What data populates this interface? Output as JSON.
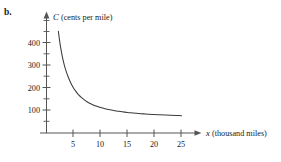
{
  "part_label": "b.",
  "chart_data": {
    "type": "line",
    "title": "",
    "xlabel_var": "x",
    "xlabel_units": "(thousand miles)",
    "ylabel_var": "C",
    "ylabel_units": "(cents per mile)",
    "xlim": [
      0,
      29
    ],
    "ylim": [
      0,
      480
    ],
    "grid": false,
    "legend": "none",
    "x_ticks_major": [
      5,
      10,
      15,
      20,
      25
    ],
    "x_tick_labels": [
      "5",
      "10",
      "15",
      "20",
      "25"
    ],
    "y_ticks_major": [
      100,
      200,
      300,
      400
    ],
    "y_tick_labels": [
      "100",
      "200",
      "300",
      "400"
    ],
    "y_ticks_minor": [
      50,
      150,
      250,
      350,
      450
    ],
    "series": [
      {
        "name": "C(x)",
        "curve_color": "#3a3a3a",
        "x": [
          2.2,
          2.4,
          2.6,
          2.8,
          3.0,
          3.3,
          3.6,
          4.0,
          4.5,
          5.0,
          5.5,
          6.0,
          6.5,
          7.0,
          7.5,
          8.0,
          9.0,
          10.0,
          11.0,
          12.0,
          13.0,
          14.0,
          15.0,
          16.0,
          17.0,
          18.0,
          19.0,
          20.0,
          21.0,
          22.0,
          23.0,
          24.0,
          25.0
        ],
        "y": [
          452,
          415,
          383,
          356,
          332,
          302,
          277,
          250,
          222,
          200,
          183,
          168,
          157,
          147,
          139,
          132,
          121,
          113,
          107,
          102,
          98,
          94,
          91,
          89,
          87,
          85,
          83,
          82,
          81,
          80,
          79,
          78,
          77
        ]
      }
    ],
    "annotations": [],
    "axes_color": "#555555",
    "text_color": "#1a1a1a"
  }
}
